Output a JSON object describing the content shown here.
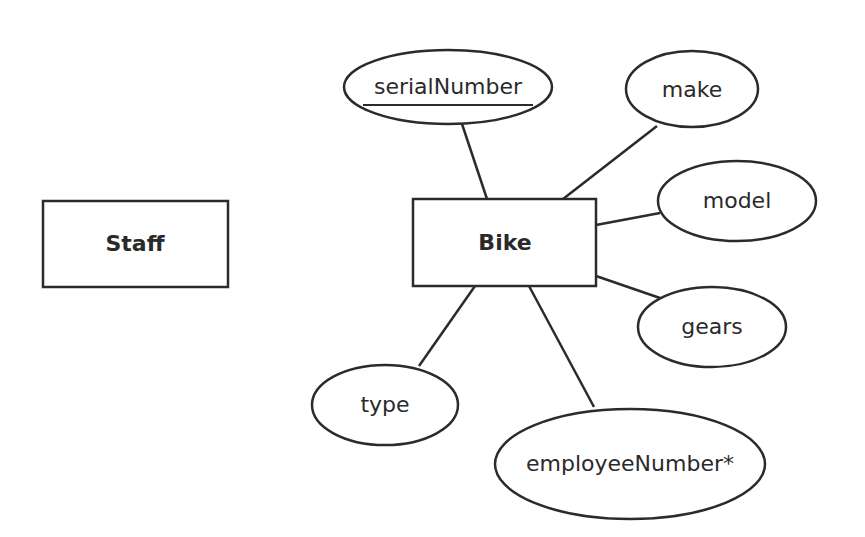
{
  "diagram": {
    "type": "entity-relationship",
    "colors": {
      "stroke": "#2b2b2b",
      "text": "#2a2a2a",
      "background": "#ffffff"
    },
    "entities": [
      {
        "id": "staff",
        "label": "Staff"
      },
      {
        "id": "bike",
        "label": "Bike"
      }
    ],
    "attributes": [
      {
        "id": "serialNumber",
        "label": "serialNumber",
        "entity": "bike",
        "primary_key": true
      },
      {
        "id": "make",
        "label": "make",
        "entity": "bike"
      },
      {
        "id": "model",
        "label": "model",
        "entity": "bike"
      },
      {
        "id": "gears",
        "label": "gears",
        "entity": "bike"
      },
      {
        "id": "type",
        "label": "type",
        "entity": "bike"
      },
      {
        "id": "employeeNumber",
        "label": "employeeNumber*",
        "entity": "bike",
        "foreign_key": true
      }
    ]
  }
}
